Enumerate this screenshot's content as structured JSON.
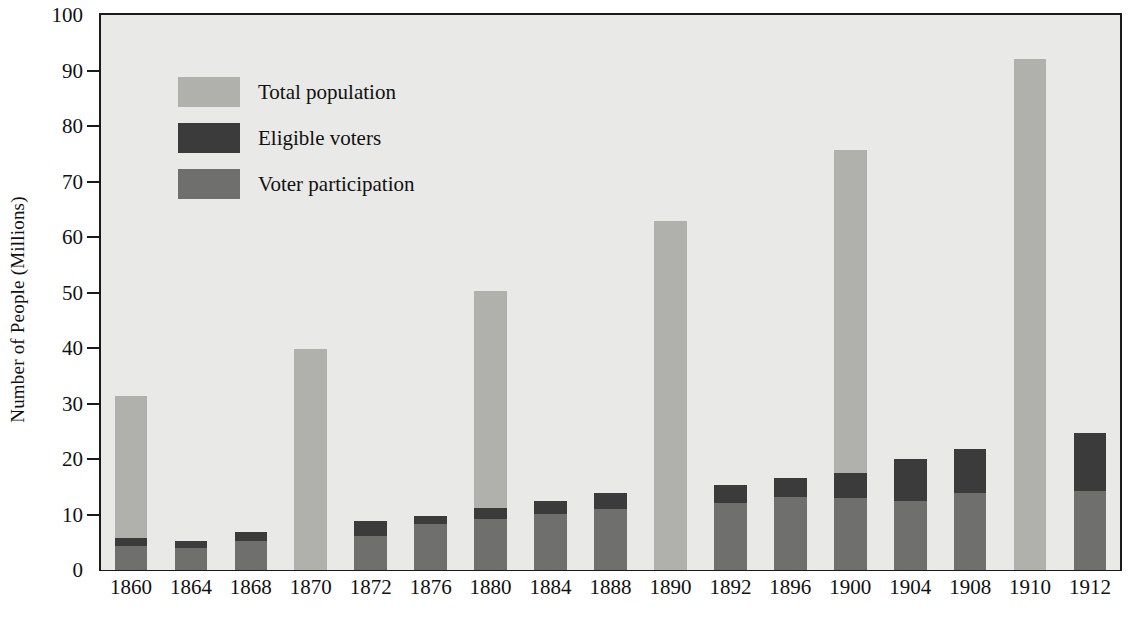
{
  "chart_data": {
    "type": "bar",
    "stacked": true,
    "title": "",
    "xlabel": "",
    "ylabel": "Number of People (Millions)",
    "ylim": [
      0,
      100
    ],
    "ytick_values": [
      0,
      10,
      20,
      30,
      40,
      50,
      60,
      70,
      80,
      90,
      100
    ],
    "ytick_labels": [
      "0",
      "10",
      "20",
      "30",
      "40",
      "50",
      "60",
      "70",
      "80",
      "90",
      "100"
    ],
    "grid": false,
    "legend_position": "upper-left-inside",
    "categories": [
      "1860",
      "1864",
      "1868",
      "1870",
      "1872",
      "1876",
      "1880",
      "1884",
      "1888",
      "1890",
      "1892",
      "1896",
      "1900",
      "1904",
      "1908",
      "1910",
      "1912"
    ],
    "series": [
      {
        "name": "Total population",
        "color": "#b0b0ad",
        "values": [
          31.4,
          null,
          null,
          39.8,
          null,
          null,
          50.2,
          null,
          null,
          62.9,
          null,
          null,
          75.6,
          null,
          null,
          92.0,
          null
        ]
      },
      {
        "name": "Eligible voters",
        "color": "#3b3b3b",
        "values": [
          5.8,
          5.3,
          6.9,
          null,
          8.8,
          9.7,
          11.2,
          12.5,
          13.8,
          null,
          15.3,
          16.6,
          17.4,
          20.0,
          21.8,
          null,
          24.6
        ]
      },
      {
        "name": "Voter participation",
        "color": "#6f6f6d",
        "values": [
          4.3,
          4.0,
          5.3,
          null,
          6.1,
          8.3,
          9.2,
          10.1,
          11.0,
          null,
          12.0,
          13.2,
          13.0,
          12.5,
          13.8,
          null,
          14.3
        ]
      }
    ]
  },
  "legend": {
    "items": [
      {
        "label": "Total population",
        "color": "#b0b0ad"
      },
      {
        "label": "Eligible voters",
        "color": "#3b3b3b"
      },
      {
        "label": "Voter participation",
        "color": "#6f6f6d"
      }
    ]
  },
  "axes": {
    "y_title": "Number of People (Millions)"
  }
}
